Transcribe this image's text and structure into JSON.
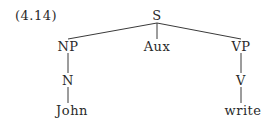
{
  "example_number": "(4.14)",
  "tree": {
    "root": "S",
    "nodes": {
      "S": "S",
      "NP": "NP",
      "Aux": "Aux",
      "VP": "VP",
      "N": "N",
      "V": "V",
      "John": "John",
      "write": "write"
    },
    "edges": [
      [
        "S",
        "NP"
      ],
      [
        "S",
        "Aux"
      ],
      [
        "S",
        "VP"
      ],
      [
        "NP",
        "N"
      ],
      [
        "N",
        "John"
      ],
      [
        "VP",
        "V"
      ],
      [
        "V",
        "write"
      ]
    ]
  },
  "colors": {
    "text": "#2a2a2a",
    "line": "#3a3a3a",
    "background": "#ffffff"
  }
}
